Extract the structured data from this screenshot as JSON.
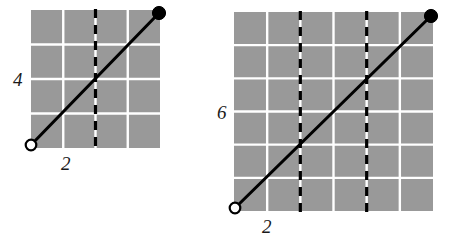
{
  "page": {
    "background": "#ffffff"
  },
  "style": {
    "grid_fill": "#999999",
    "grid_line_color": "#ffffff",
    "dashed_line_color": "#000000",
    "segment_color": "#000000",
    "open_point_fill": "#ffffff",
    "closed_point_fill": "#000000"
  },
  "figures": [
    {
      "id": "left-figure",
      "name": "left-grid-diagram",
      "grid": {
        "cols": 4,
        "rows": 4,
        "x": 31,
        "y": 10,
        "width": 129,
        "height": 138,
        "cell_width": 32.25,
        "cell_height": 34.5
      },
      "dashed_lines": [
        {
          "name": "dashed-line-1",
          "col_index": 2
        }
      ],
      "segment": {
        "name": "line-segment",
        "start": {
          "x": 31,
          "y": 145,
          "marker": "open-circle"
        },
        "end": {
          "x": 159,
          "y": 13,
          "marker": "closed-circle"
        }
      },
      "labels": {
        "y_label": "4",
        "x_label": "2"
      }
    },
    {
      "id": "right-figure",
      "name": "right-grid-diagram",
      "grid": {
        "cols": 6,
        "rows": 6,
        "x": 234,
        "y": 12,
        "width": 199,
        "height": 199,
        "cell_width": 33.17,
        "cell_height": 33.17
      },
      "dashed_lines": [
        {
          "name": "dashed-line-1",
          "col_index": 2
        },
        {
          "name": "dashed-line-2",
          "col_index": 4
        }
      ],
      "segment": {
        "name": "line-segment",
        "start": {
          "x": 235,
          "y": 208,
          "marker": "open-circle"
        },
        "end": {
          "x": 431,
          "y": 16,
          "marker": "closed-circle"
        }
      },
      "labels": {
        "y_label": "6",
        "x_label": "2"
      }
    }
  ],
  "chart_data": {
    "type": "line",
    "title": "",
    "panels": [
      {
        "name": "left",
        "grid_cols": 4,
        "grid_rows": 4,
        "y_axis_label": "4",
        "x_axis_label": "2",
        "dashed_vertical_gridlines_at": [
          2
        ],
        "series": [
          {
            "name": "segment",
            "points": [
              {
                "x": 0,
                "y": 0,
                "endpoint": "open"
              },
              {
                "x": 4,
                "y": 4,
                "endpoint": "closed"
              }
            ]
          }
        ],
        "xlim": [
          0,
          4
        ],
        "ylim": [
          0,
          4
        ],
        "grid": true,
        "legend": "none"
      },
      {
        "name": "right",
        "grid_cols": 6,
        "grid_rows": 6,
        "y_axis_label": "6",
        "x_axis_label": "2",
        "dashed_vertical_gridlines_at": [
          2,
          4
        ],
        "series": [
          {
            "name": "segment",
            "points": [
              {
                "x": 0,
                "y": 0,
                "endpoint": "open"
              },
              {
                "x": 6,
                "y": 6,
                "endpoint": "closed"
              }
            ]
          }
        ],
        "xlim": [
          0,
          6
        ],
        "ylim": [
          0,
          6
        ],
        "grid": true,
        "legend": "none"
      }
    ]
  }
}
